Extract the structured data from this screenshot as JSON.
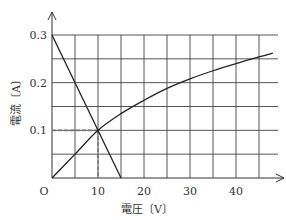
{
  "chart_data": {
    "type": "line",
    "title": "",
    "xlabel": "電圧〔V〕",
    "ylabel": "電流〔A〕",
    "origin_label": "O",
    "xlim": [
      0,
      48
    ],
    "ylim": [
      0,
      0.3
    ],
    "x_ticks": [
      10,
      20,
      30,
      40
    ],
    "x_tick_labels": [
      "10",
      "20",
      "30",
      "40"
    ],
    "y_ticks": [
      0.1,
      0.2,
      0.3
    ],
    "y_tick_labels": [
      "0.1",
      "0.2",
      "0.3"
    ],
    "grid": true,
    "grid_x_step": 5,
    "grid_y_step": 0.05,
    "series": [
      {
        "name": "straight line (decreasing)",
        "x": [
          0,
          15
        ],
        "y": [
          0.3,
          0
        ]
      },
      {
        "name": "curve (increasing)",
        "x": [
          0,
          5,
          10,
          15,
          20,
          25,
          30,
          35,
          40,
          45,
          48
        ],
        "y": [
          0,
          0.05,
          0.1,
          0.135,
          0.163,
          0.188,
          0.208,
          0.225,
          0.24,
          0.254,
          0.262
        ]
      }
    ],
    "annotations": [
      {
        "type": "dashed-guide",
        "x": 10,
        "y": 0.1,
        "note": "intersection point"
      }
    ]
  }
}
